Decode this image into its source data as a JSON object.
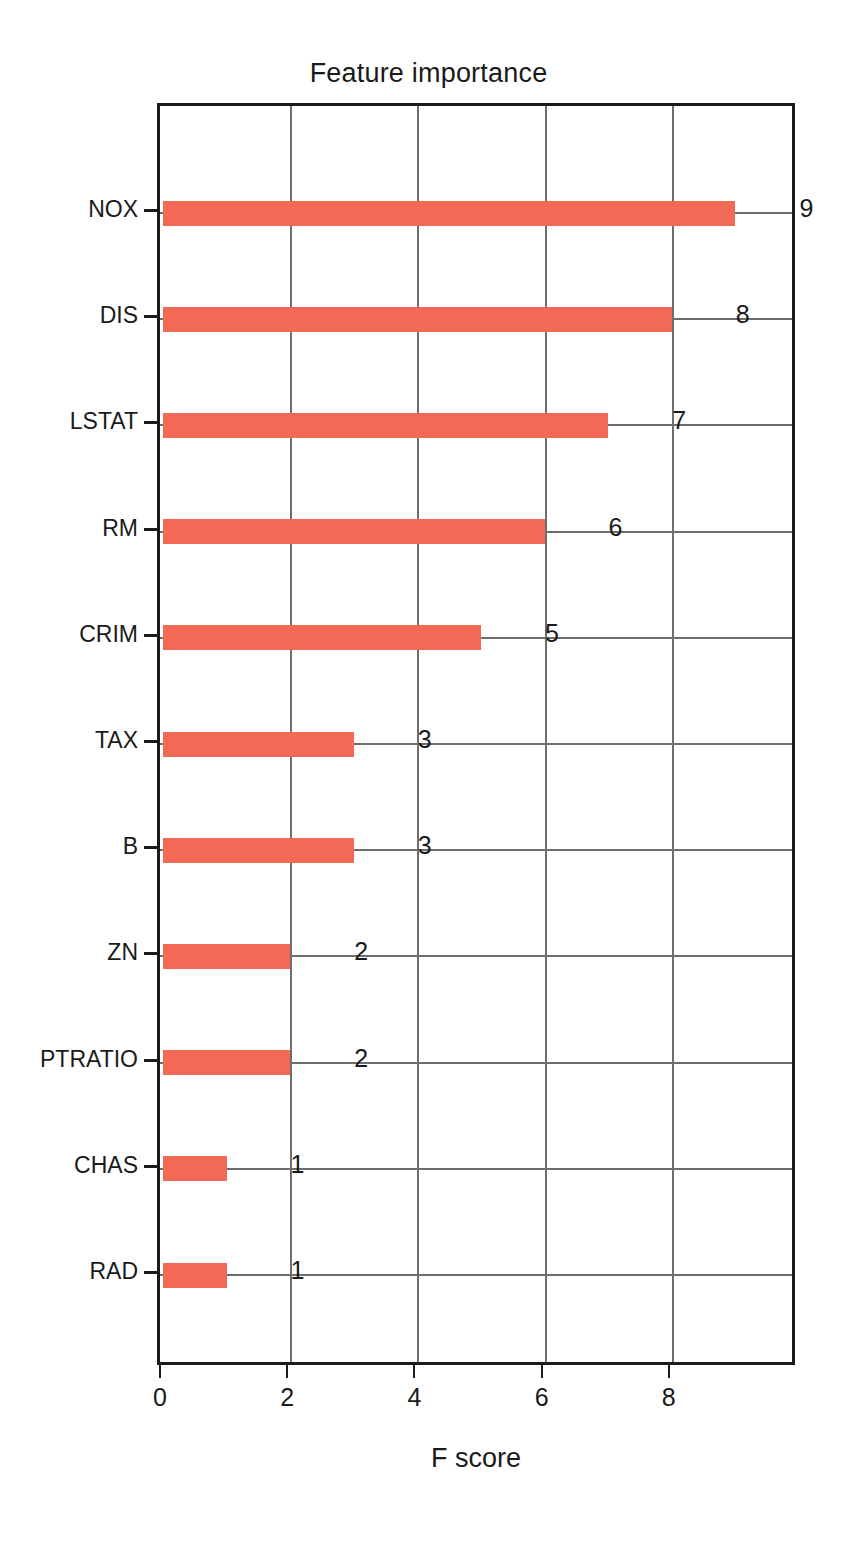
{
  "chart_data": {
    "type": "bar",
    "orientation": "horizontal",
    "title": "Feature importance",
    "xlabel": "F score",
    "ylabel": "",
    "categories": [
      "NOX",
      "DIS",
      "LSTAT",
      "RM",
      "CRIM",
      "TAX",
      "B",
      "ZN",
      "PTRATIO",
      "CHAS",
      "RAD"
    ],
    "values": [
      9,
      8,
      7,
      6,
      5,
      3,
      3,
      2,
      2,
      1,
      1
    ],
    "value_labels": [
      "9",
      "8",
      "7",
      "6",
      "5",
      "3",
      "3",
      "2",
      "2",
      "1",
      "1"
    ],
    "xticks": [
      0,
      2,
      4,
      6,
      8
    ],
    "xtick_labels": [
      "0",
      "2",
      "4",
      "6",
      "8"
    ],
    "xlim": [
      0,
      10
    ],
    "grid": true,
    "bar_color": "#f26a55",
    "axis_color": "#1b1b1b",
    "grid_color": "#6e6e6e",
    "legend": null
  }
}
